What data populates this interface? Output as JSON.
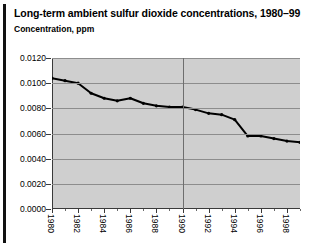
{
  "header": {
    "title": "Long-term ambient sulfur dioxide concentrations, 1980–99",
    "subtitle": "Concentration, ppm"
  },
  "colors": {
    "plot_background": "#cfcfcf",
    "grid": "#8d8d8d",
    "axis": "#3a3a3a",
    "line": "#000000",
    "page_background": "#ffffff",
    "rule": "#111111"
  },
  "chart_data": {
    "type": "line",
    "title": "Long-term ambient sulfur dioxide concentrations, 1980–99",
    "xlabel": "",
    "ylabel": "Concentration, ppm",
    "ylim": [
      0.0,
      0.012
    ],
    "xlim": [
      1980,
      1999
    ],
    "grid": true,
    "legend": "none",
    "ytick_labels": [
      "0.0120",
      "0.0100",
      "0.0080",
      "0.0060",
      "0.0040",
      "0.0020",
      "0.0000"
    ],
    "ytick_values": [
      0.012,
      0.01,
      0.008,
      0.006,
      0.004,
      0.002,
      0.0
    ],
    "xtick_labels": [
      "1980",
      "1982",
      "1984",
      "1986",
      "1988",
      "1990",
      "1992",
      "1994",
      "1996",
      "1998"
    ],
    "xtick_values": [
      1980,
      1982,
      1984,
      1986,
      1988,
      1990,
      1992,
      1994,
      1996,
      1998
    ],
    "annotations": [
      {
        "type": "vertical-line",
        "x": 1990,
        "label": ""
      }
    ],
    "series": [
      {
        "name": "Ambient SO2 concentration",
        "x": [
          1980,
          1981,
          1982,
          1983,
          1984,
          1985,
          1986,
          1987,
          1988,
          1989,
          1990,
          1991,
          1992,
          1993,
          1994,
          1995,
          1996,
          1997,
          1998,
          1999
        ],
        "values": [
          0.0104,
          0.0102,
          0.01,
          0.0092,
          0.0088,
          0.0086,
          0.0088,
          0.0084,
          0.0082,
          0.0081,
          0.0081,
          0.0079,
          0.0076,
          0.0075,
          0.0071,
          0.0058,
          0.0058,
          0.0056,
          0.0054,
          0.0053
        ],
        "markers": true,
        "color": "#000000"
      }
    ]
  }
}
